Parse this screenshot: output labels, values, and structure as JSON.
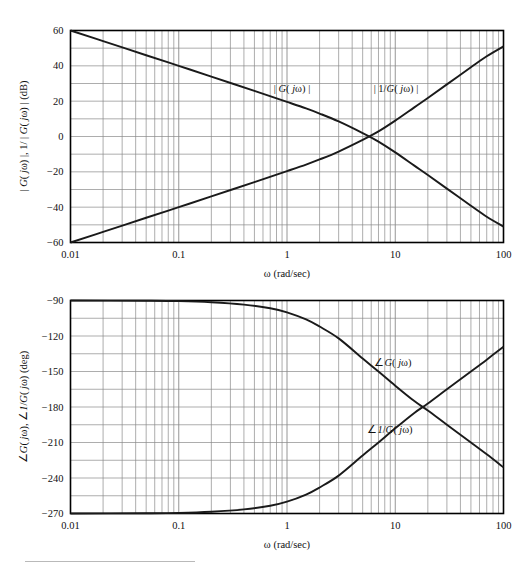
{
  "figure": {
    "title": "",
    "background": "#ffffff",
    "axis_color": "#000000",
    "grid_color": "#8a8a8a",
    "curve_color": "#1a1a1a"
  },
  "magnitude_plot": {
    "ylabel_parts": {
      "p1": "| ",
      "p2": "G",
      "p3": "( ",
      "p4": "j",
      "p5": "ω",
      "p6": ") |, 1/ | ",
      "p7": "G",
      "p8": "( ",
      "p9": "j",
      "p10": "ω",
      "p11": ") | (dB)"
    },
    "ylabel_plain": "| G( jω) |, 1/ | G( jω) | (dB)",
    "xlabel": "ω (rad/sec)",
    "yticks": [
      "60",
      "40",
      "20",
      "0",
      "−20",
      "−40",
      "−60"
    ],
    "ytick_values": [
      60,
      40,
      20,
      0,
      -20,
      -40,
      -60
    ],
    "xticks": [
      "0.01",
      "0.1",
      "1",
      "10",
      "100"
    ],
    "xtick_values": [
      0.01,
      0.1,
      1,
      10,
      100
    ],
    "ylim": [
      -60,
      60
    ],
    "xlim": [
      0.01,
      100
    ],
    "curve_labels": [
      {
        "id": "mag-G",
        "text_plain": "| G( jω) |",
        "x": 2.2,
        "y": 25
      },
      {
        "id": "mag-invG",
        "text_plain": "| 1/G( jω) |",
        "x": 7.6,
        "y": 25
      }
    ]
  },
  "phase_plot": {
    "ylabel_plain": "∠G( jω), ∠1/G( jω) (deg)",
    "xlabel": "ω (rad/sec)",
    "yticks": [
      "−90",
      "−120",
      "−150",
      "−180",
      "−210",
      "−240",
      "−270"
    ],
    "ytick_values": [
      -90,
      -120,
      -150,
      -180,
      -210,
      -240,
      -270
    ],
    "xticks": [
      "0.01",
      "0.1",
      "1",
      "10",
      "100"
    ],
    "xtick_values": [
      0.01,
      0.1,
      1,
      10,
      100
    ],
    "ylim": [
      -270,
      -90
    ],
    "xlim": [
      0.01,
      100
    ],
    "curve_labels": [
      {
        "id": "phase-G",
        "text_plain": "∠G( jω)",
        "x": 7.0,
        "y": -143
      },
      {
        "id": "phase-invG",
        "text_plain": "∠1/G( jω)",
        "x": 7.0,
        "y": -217
      }
    ]
  },
  "chart_data": {
    "type": "line",
    "title": "",
    "panels": [
      {
        "id": "magnitude",
        "xlabel": "ω (rad/sec)",
        "ylabel": "| G( jω) |, 1/ | G( jω) | (dB)",
        "xscale": "log",
        "xlim": [
          0.01,
          100
        ],
        "ylim": [
          -60,
          60
        ],
        "xticks": [
          0.01,
          0.1,
          1,
          10,
          100
        ],
        "xticklabels": [
          "0.01",
          "0.1",
          "1",
          "10",
          "100"
        ],
        "yticks": [
          -60,
          -40,
          -20,
          0,
          20,
          40,
          60
        ],
        "yticklabels": [
          "−60",
          "−40",
          "−20",
          "0",
          "20",
          "40",
          "60"
        ],
        "grid": "log-minor-vertical + major-horizontal",
        "series": [
          {
            "name": "| G( jω) |",
            "label_pos": {
              "x": 2.2,
              "y": 25
            },
            "x": [
              0.01,
              0.02,
              0.05,
              0.1,
              0.2,
              0.5,
              1,
              1.5,
              2,
              3,
              5,
              7,
              10,
              15,
              20,
              30,
              50,
              70,
              100
            ],
            "y": [
              60.0,
              54.0,
              46.0,
              40.0,
              33.9,
              25.8,
              19.6,
              15.9,
              13.0,
              8.5,
              1.9,
              -2.9,
              -9.0,
              -16.5,
              -21.8,
              -29.5,
              -39.2,
              -45.4,
              -51.0
            ]
          },
          {
            "name": "| 1/G( jω) |",
            "label_pos": {
              "x": 7.6,
              "y": 25
            },
            "x": [
              0.01,
              0.02,
              0.05,
              0.1,
              0.2,
              0.5,
              1,
              1.5,
              2,
              3,
              5,
              7,
              10,
              15,
              20,
              30,
              50,
              70,
              100
            ],
            "y": [
              -60.0,
              -54.0,
              -46.0,
              -40.0,
              -33.9,
              -25.8,
              -19.6,
              -15.9,
              -13.0,
              -8.5,
              -1.9,
              2.9,
              9.0,
              16.5,
              21.8,
              29.5,
              39.2,
              45.4,
              51.0
            ]
          }
        ]
      },
      {
        "id": "phase",
        "xlabel": "ω (rad/sec)",
        "ylabel": "∠G( jω), ∠1/G( jω) (deg)",
        "xscale": "log",
        "xlim": [
          0.01,
          100
        ],
        "ylim": [
          -270,
          -90
        ],
        "xticks": [
          0.01,
          0.1,
          1,
          10,
          100
        ],
        "xticklabels": [
          "0.01",
          "0.1",
          "1",
          "10",
          "100"
        ],
        "yticks": [
          -270,
          -240,
          -210,
          -180,
          -150,
          -120,
          -90
        ],
        "yticklabels": [
          "−270",
          "−240",
          "−210",
          "−180",
          "−150",
          "−120",
          "−90"
        ],
        "grid": "log-minor-vertical + major-horizontal",
        "series": [
          {
            "name": "∠G( jω)",
            "label_pos": {
              "x": 7.0,
              "y": -143
            },
            "x": [
              0.01,
              0.05,
              0.1,
              0.2,
              0.4,
              0.7,
              1,
              1.5,
              2,
              3,
              5,
              7,
              10,
              15,
              20,
              30,
              50,
              70,
              100
            ],
            "y": [
              -90.0,
              -90.2,
              -90.5,
              -91.5,
              -93.5,
              -96.5,
              -100.0,
              -106.0,
              -112.0,
              -122.0,
              -139.0,
              -150.0,
              -162.0,
              -175.0,
              -183.0,
              -195.0,
              -210.0,
              -220.0,
              -231.0
            ]
          },
          {
            "name": "∠1/G( jω)",
            "label_pos": {
              "x": 7.0,
              "y": -217
            },
            "x": [
              0.01,
              0.05,
              0.1,
              0.2,
              0.4,
              0.7,
              1,
              1.5,
              2,
              3,
              5,
              7,
              10,
              15,
              20,
              30,
              50,
              70,
              100
            ],
            "y": [
              -270.0,
              -269.8,
              -269.5,
              -268.5,
              -266.5,
              -263.5,
              -260.0,
              -254.0,
              -248.0,
              -238.0,
              -221.0,
              -210.0,
              -198.0,
              -185.0,
              -177.0,
              -165.0,
              -150.0,
              -140.0,
              -129.0
            ]
          }
        ]
      }
    ]
  }
}
